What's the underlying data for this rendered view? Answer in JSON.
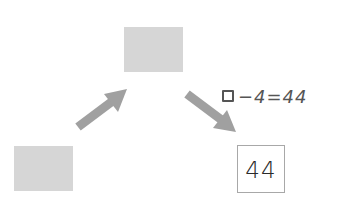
{
  "diagram": {
    "boxes": [
      {
        "id": "top",
        "type": "placeholder",
        "fill": "#d6d6d6",
        "label": ""
      },
      {
        "id": "bottom-left",
        "type": "placeholder",
        "fill": "#d6d6d6",
        "label": ""
      }
    ],
    "result": {
      "value": "44"
    },
    "equation": {
      "blank": "□",
      "text": "−4=44",
      "full": "□−4=44"
    },
    "arrows": [
      {
        "from": "bottom-left",
        "to": "top",
        "color": "#a0a0a0"
      },
      {
        "from": "top",
        "to": "result",
        "color": "#a0a0a0"
      }
    ]
  }
}
